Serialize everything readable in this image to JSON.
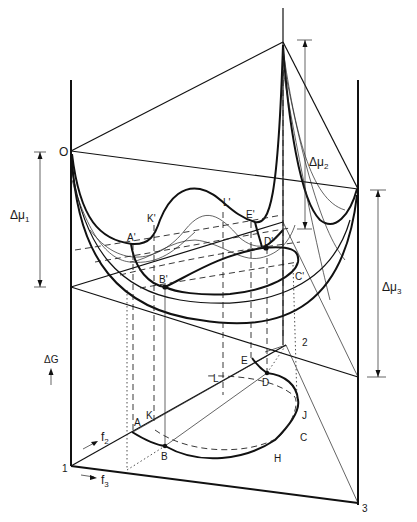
{
  "figure": {
    "type": "ternary free-energy surface diagram (3D perspective)",
    "axis_label": "ΔG",
    "composition_axes": [
      {
        "label": "f",
        "subscript": "2"
      },
      {
        "label": "f",
        "subscript": "3"
      }
    ],
    "vertices": [
      "1",
      "2",
      "3",
      "O"
    ],
    "chemical_potential_brackets": [
      {
        "label": "Δμ",
        "subscript": "1"
      },
      {
        "label": "Δμ",
        "subscript": "2"
      },
      {
        "label": "Δμ",
        "subscript": "3"
      }
    ],
    "surface_points": [
      "A'",
      "K'",
      "L'",
      "E'",
      "D'",
      "B'",
      "C'"
    ],
    "base_points": [
      "A",
      "K",
      "L",
      "E",
      "D",
      "B",
      "C",
      "H",
      "J"
    ]
  },
  "labels": {
    "O": "O",
    "one": "1",
    "two": "2",
    "three": "3",
    "dG": "ΔG",
    "f": "f",
    "f2_sub": "2",
    "f3_sub": "3",
    "dmu": "Δμ",
    "mu1_sub": "1",
    "mu2_sub": "2",
    "mu3_sub": "3",
    "Ap": "A'",
    "Kp": "K'",
    "Lp": "L'",
    "Ep": "E'",
    "Dp": "D'",
    "Bp": "B'",
    "Cp": "C'",
    "A": "A",
    "K": "K",
    "L": "L",
    "E": "E",
    "D": "D",
    "B": "B",
    "C": "C",
    "H": "H",
    "J": "J"
  }
}
